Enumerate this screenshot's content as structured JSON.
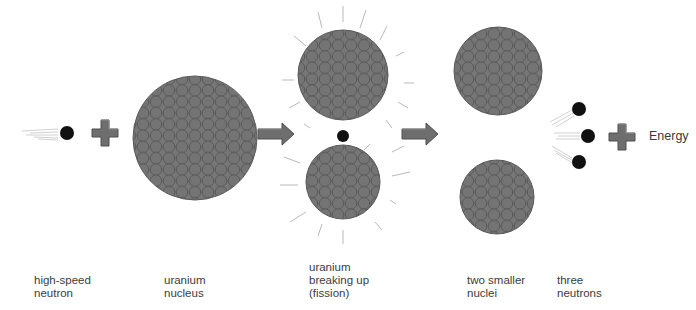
{
  "diagram": {
    "type": "nuclear-fission-illustration",
    "colors": {
      "nucleus_fill": "#6c6c6c",
      "nucleon_stroke": "#565656",
      "nucleon_fill": "#767676",
      "neutron": "#111111",
      "symbol_fill": "#6e6e6e",
      "symbol_edge": "#4a4a4a",
      "ray": "#b9b9b9",
      "speed_line": "#c4c4c4",
      "text": "#3c3c3c"
    },
    "stages": [
      {
        "id": "high-speed-neutron",
        "label": "high-speed\nneutron"
      },
      {
        "id": "uranium-nucleus",
        "label": "uranium\nnucleus"
      },
      {
        "id": "fission",
        "label": "uranium\nbreaking up\n(fission)"
      },
      {
        "id": "smaller-nuclei",
        "label": "two smaller\nnuclei"
      },
      {
        "id": "three-neutrons",
        "label": "three\nneutrons"
      }
    ],
    "energy_label": "Energy",
    "symbols": {
      "plus": "plus-icon",
      "arrow": "arrow-right-icon"
    }
  }
}
